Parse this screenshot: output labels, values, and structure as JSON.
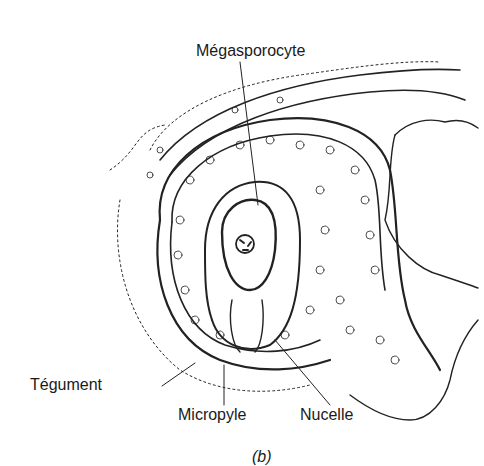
{
  "figure": {
    "caption": "(b)",
    "labels": {
      "megasporocyte": "Mégasporocyte",
      "tegument": "Tégument",
      "micropyle": "Micropyle",
      "nucelle": "Nucelle"
    }
  }
}
